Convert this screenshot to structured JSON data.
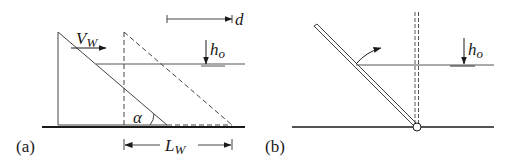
{
  "panel_a": {
    "label": "(a)",
    "velocity_label": "V",
    "velocity_sub": "W",
    "displacement_label": "d",
    "depth_label": "h",
    "depth_sub": "o",
    "angle_label": "α",
    "length_label": "L",
    "length_sub": "W"
  },
  "panel_b": {
    "label": "(b)",
    "depth_label": "h",
    "depth_sub": "o"
  },
  "colors": {
    "line": "#1a1a1a",
    "thin": "#444444",
    "water": "#555555"
  }
}
